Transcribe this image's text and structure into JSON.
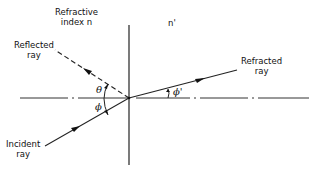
{
  "diagram": {
    "type": "refraction-reflection-at-interface",
    "media": {
      "left": {
        "label_line1": "Refractive",
        "label_line2": "index n"
      },
      "right": {
        "label": "n'"
      }
    },
    "rays": {
      "reflected": {
        "label_line1": "Reflected",
        "label_line2": "ray",
        "style": "dashed"
      },
      "refracted": {
        "label_line1": "Refracted",
        "label_line2": "ray",
        "style": "solid"
      },
      "incident": {
        "label_line1": "Incident",
        "label_line2": "ray",
        "style": "solid"
      }
    },
    "angles": {
      "reflection": "θ",
      "incidence": "ϕ",
      "refraction": "ϕ'"
    },
    "axis": {
      "style": "dash-dot",
      "description": "horizontal reference axis"
    },
    "interface": {
      "style": "solid",
      "description": "vertical boundary between media"
    },
    "colors": {
      "ink": "#111111",
      "background": "#ffffff"
    }
  }
}
